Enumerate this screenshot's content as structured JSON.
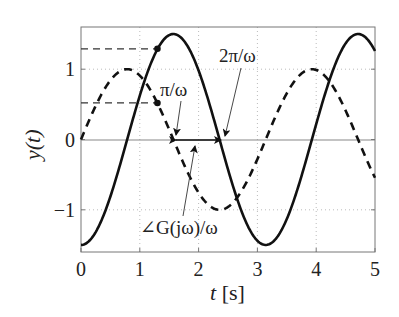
{
  "chart_data": {
    "type": "line",
    "title": "",
    "xlabel": "t [s]",
    "ylabel": "y(t)",
    "xlim": [
      0,
      5
    ],
    "ylim": [
      -1.6,
      1.6
    ],
    "xticks": [
      0,
      1,
      2,
      3,
      4,
      5
    ],
    "yticks": [
      -1,
      0,
      1
    ],
    "xtick_labels": [
      "0",
      "1",
      "2",
      "3",
      "4",
      "5"
    ],
    "ytick_labels": [
      "−1",
      "0",
      "1"
    ],
    "grid": true,
    "legend": null,
    "omega": 2,
    "series": [
      {
        "name": "output",
        "style": "solid",
        "formula": "y = -1.5*cos(2t)",
        "amplitude": 1.5,
        "x": [
          0,
          0.5,
          0.79,
          1.0,
          1.3,
          1.57,
          2.0,
          2.36,
          2.6,
          3.14,
          3.5,
          3.93,
          4.3,
          4.71,
          5.0
        ],
        "y": [
          -1.5,
          -0.81,
          0.0,
          0.62,
          1.29,
          1.5,
          0.98,
          0.0,
          -0.69,
          -1.5,
          -1.13,
          0.0,
          1.03,
          1.5,
          1.26
        ]
      },
      {
        "name": "input",
        "style": "dashed",
        "formula": "u = sin(2t)",
        "amplitude": 1,
        "x": [
          0,
          0.39,
          0.79,
          1.18,
          1.3,
          1.57,
          1.96,
          2.36,
          2.75,
          3.14,
          3.53,
          3.93,
          4.32,
          4.71,
          5.0
        ],
        "y": [
          0.0,
          0.71,
          1.0,
          0.71,
          0.52,
          0.0,
          -0.71,
          -1.0,
          -0.71,
          0.0,
          0.71,
          1.0,
          0.71,
          0.0,
          -0.54
        ]
      }
    ],
    "markers": [
      {
        "t": 1.3,
        "y": 1.29,
        "series": "output"
      },
      {
        "t": 1.3,
        "y": 0.52,
        "series": "input"
      }
    ],
    "reference_lines": [
      {
        "type": "hline-dashed",
        "y": 1.29,
        "x_from": 0,
        "x_to": 1.3
      },
      {
        "type": "hline-dashed",
        "y": 0.52,
        "x_from": 0,
        "x_to": 1.3
      }
    ],
    "annotations": [
      {
        "text": "π/ω",
        "points_to_t": 1.57
      },
      {
        "text": "2π/ω",
        "points_to_t": 2.4
      },
      {
        "text": "∠G(jω)/ω",
        "points_to": "double-arrow between t=1.57 and t=2.36"
      }
    ]
  },
  "labels": {
    "xlabel_t": "t",
    "xlabel_unit": " [s]",
    "ylabel": "y(t)",
    "pi_over_omega": "π/ω",
    "two_pi_over_omega": "2π/ω",
    "phase_label": "∠G(jω)/ω"
  }
}
